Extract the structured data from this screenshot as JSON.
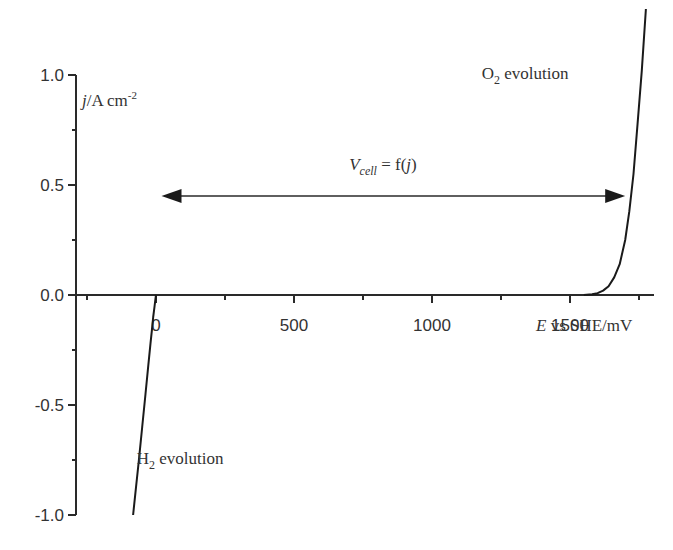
{
  "chart_data": {
    "type": "line",
    "title": "",
    "xlabel": "E vs SHE/mV",
    "xlabel_parts": {
      "var": "E",
      "rest": " vs SHE/mV"
    },
    "ylabel": "j/A cm-2",
    "ylabel_parts": {
      "var": "j",
      "rest": "/A cm",
      "sup": "-2"
    },
    "xlim": [
      -280,
      1800
    ],
    "ylim": [
      -1.0,
      1.3
    ],
    "x_ticks": [
      0,
      500,
      1000,
      1500
    ],
    "x_tick_labels": [
      "0",
      "500",
      "1000",
      "1500"
    ],
    "x_minor_ticks": [
      -250,
      250,
      750,
      1250,
      1750
    ],
    "y_ticks": [
      1.0,
      0.5,
      0.0,
      -0.5,
      -1.0
    ],
    "y_tick_labels": [
      "1.0",
      "0.5",
      "0.0",
      "-0.5",
      "-1.0"
    ],
    "y_minor_ticks": [
      0.75,
      0.25,
      -0.25,
      -0.75
    ],
    "grid": false,
    "series": [
      {
        "name": "H2 evolution",
        "x": [
          0,
          -2,
          -5,
          -10,
          -15,
          -20,
          -28,
          -38,
          -50,
          -62,
          -72,
          -83
        ],
        "y": [
          0.0,
          -0.02,
          -0.05,
          -0.1,
          -0.16,
          -0.22,
          -0.32,
          -0.45,
          -0.6,
          -0.75,
          -0.87,
          -1.0
        ]
      },
      {
        "name": "O2 evolution",
        "x": [
          1550,
          1580,
          1600,
          1620,
          1640,
          1660,
          1680,
          1700,
          1715,
          1730,
          1745,
          1760,
          1775
        ],
        "y": [
          0.0,
          0.003,
          0.008,
          0.02,
          0.04,
          0.08,
          0.14,
          0.25,
          0.38,
          0.55,
          0.78,
          1.02,
          1.3
        ]
      }
    ],
    "annotations": [
      {
        "name": "o2-label",
        "main": "O",
        "sub": "2",
        "rest": " evolution",
        "x": 1180,
        "y": 0.98
      },
      {
        "name": "h2-label",
        "main": "H",
        "sub": "2",
        "rest": " evolution",
        "x": -70,
        "y": -0.77
      },
      {
        "name": "vcell-label",
        "main": "V",
        "sub": "cell",
        "rest": " = f(",
        "var2": "j",
        "close": ")",
        "x": 700,
        "y": 0.57
      }
    ],
    "arrow": {
      "from_x": 20,
      "to_x": 1700,
      "y": 0.45,
      "style": "double-headed"
    }
  }
}
